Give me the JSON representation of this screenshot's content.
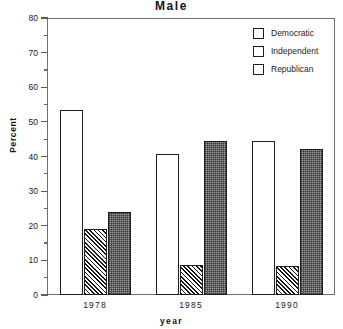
{
  "chart_data": {
    "type": "bar",
    "title": "Male",
    "xlabel": "year",
    "ylabel": "Percent",
    "categories": [
      "1978",
      "1985",
      "1990"
    ],
    "series": [
      {
        "name": "Democratic",
        "pattern": "empty",
        "values": [
          53.5,
          40.7,
          44.4
        ]
      },
      {
        "name": "Independent",
        "pattern": "hatch",
        "values": [
          19.0,
          8.7,
          8.4
        ]
      },
      {
        "name": "Republican",
        "pattern": "stipple",
        "values": [
          24.0,
          44.5,
          42.2
        ]
      }
    ],
    "ylim": [
      0,
      80
    ],
    "ytick_labels": [
      "0",
      "10",
      "20",
      "30",
      "40",
      "50",
      "60",
      "70",
      "80"
    ],
    "ytick_values": [
      0,
      10,
      20,
      30,
      40,
      50,
      60,
      70,
      80
    ],
    "yminor_values": [
      5,
      15,
      25,
      35,
      45,
      55,
      65,
      75
    ],
    "grid": false,
    "legend_position": "top-right-inside",
    "legend_entries": [
      "Democratic",
      "Independent",
      "Republican"
    ],
    "colors": {
      "axis": "#6f6f6f",
      "bar_outline": "#1d1d1d",
      "democratic_fill": "#ffffff",
      "independent_fill": "#161616",
      "republican_fill": "#9d9d9d",
      "text": "#1a1a1a",
      "background": "#ffffff"
    }
  }
}
